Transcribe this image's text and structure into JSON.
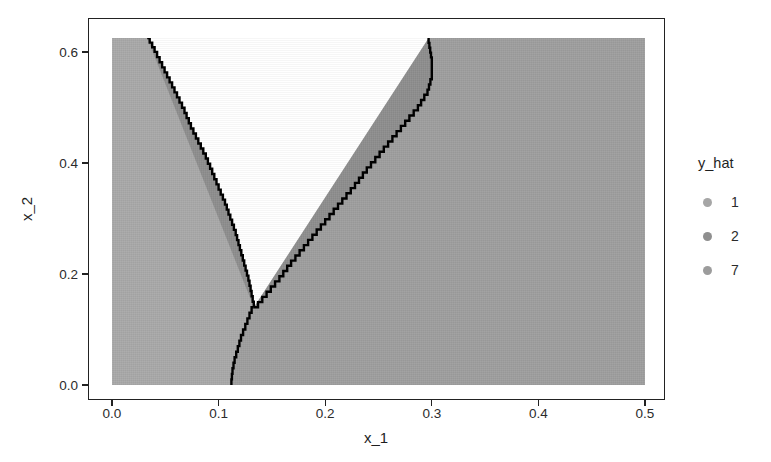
{
  "chart_data": {
    "type": "heatmap",
    "title": "",
    "subtitle": "",
    "xlabel": "x_1",
    "ylabel": "x_2",
    "xlim": [
      0.0,
      0.5
    ],
    "ylim": [
      0.0,
      0.625
    ],
    "xticks": [
      "0.0",
      "0.1",
      "0.2",
      "0.3",
      "0.4",
      "0.5"
    ],
    "xtick_values": [
      0.0,
      0.1,
      0.2,
      0.3,
      0.4,
      0.5
    ],
    "yticks": [
      "0.0",
      "0.2",
      "0.4",
      "0.6"
    ],
    "ytick_values": [
      0.0,
      0.2,
      0.4,
      0.6
    ],
    "grid": false,
    "legend": {
      "title": "y_hat",
      "position": "right",
      "entries": [
        {
          "label": "1",
          "color": "#a6a6a6"
        },
        {
          "label": "2",
          "color": "#8f8f8f"
        },
        {
          "label": "7",
          "color": "#9c9c9c"
        }
      ]
    },
    "regions": [
      {
        "class_label": "1",
        "color": "#a8a8a8",
        "description": "left region, x_1 below the left decision boundary"
      },
      {
        "class_label": "2",
        "color": "#8d8d8d",
        "description": "central wedge between the two decision boundaries"
      },
      {
        "class_label": "7",
        "color": "#9e9e9e",
        "description": "right region, x_1 above the right decision boundary"
      }
    ],
    "decision_boundaries": [
      {
        "name": "left-boundary",
        "color": "#000000",
        "points": [
          [
            0.033,
            0.625
          ],
          [
            0.04,
            0.6
          ],
          [
            0.047,
            0.572
          ],
          [
            0.054,
            0.545
          ],
          [
            0.061,
            0.518
          ],
          [
            0.068,
            0.49
          ],
          [
            0.074,
            0.462
          ],
          [
            0.081,
            0.435
          ],
          [
            0.088,
            0.408
          ],
          [
            0.094,
            0.38
          ],
          [
            0.1,
            0.352
          ],
          [
            0.106,
            0.325
          ],
          [
            0.111,
            0.298
          ],
          [
            0.116,
            0.27
          ],
          [
            0.12,
            0.243
          ],
          [
            0.124,
            0.215
          ],
          [
            0.128,
            0.188
          ],
          [
            0.131,
            0.16
          ],
          [
            0.133,
            0.14
          ]
        ]
      },
      {
        "name": "right-boundary",
        "color": "#000000",
        "points": [
          [
            0.133,
            0.14
          ],
          [
            0.145,
            0.168
          ],
          [
            0.157,
            0.196
          ],
          [
            0.168,
            0.224
          ],
          [
            0.18,
            0.252
          ],
          [
            0.192,
            0.28
          ],
          [
            0.204,
            0.308
          ],
          [
            0.216,
            0.336
          ],
          [
            0.228,
            0.364
          ],
          [
            0.239,
            0.392
          ],
          [
            0.251,
            0.42
          ],
          [
            0.263,
            0.448
          ],
          [
            0.275,
            0.476
          ],
          [
            0.287,
            0.504
          ],
          [
            0.296,
            0.532
          ],
          [
            0.3,
            0.56
          ],
          [
            0.3,
            0.59
          ],
          [
            0.297,
            0.625
          ]
        ]
      },
      {
        "name": "lower-stem",
        "color": "#000000",
        "points": [
          [
            0.133,
            0.14
          ],
          [
            0.129,
            0.12
          ],
          [
            0.125,
            0.1
          ],
          [
            0.121,
            0.08
          ],
          [
            0.118,
            0.06
          ],
          [
            0.115,
            0.04
          ],
          [
            0.113,
            0.02
          ],
          [
            0.112,
            0.0
          ]
        ]
      }
    ]
  },
  "axes": {
    "x_title": "x_1",
    "y_title": "x_2"
  },
  "legend": {
    "title": "y_hat",
    "items": [
      {
        "label": "1",
        "color": "#a6a6a6"
      },
      {
        "label": "2",
        "color": "#8f8f8f"
      },
      {
        "label": "7",
        "color": "#9c9c9c"
      }
    ]
  }
}
